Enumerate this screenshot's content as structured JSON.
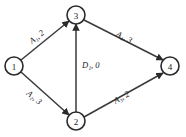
{
  "diagram": {
    "background_color": "#ffffff",
    "line_color": "#3a3a3a",
    "node_stroke_color": "#2b2b2b",
    "text_color": "#1a1a1a",
    "nodes": [
      {
        "id": "node-1",
        "label": "1",
        "cx": 14,
        "cy": 66,
        "r": 9
      },
      {
        "id": "node-3",
        "label": "3",
        "cx": 76,
        "cy": 15,
        "r": 9
      },
      {
        "id": "node-2",
        "label": "2",
        "cx": 76,
        "cy": 121,
        "r": 9
      },
      {
        "id": "node-4",
        "label": "4",
        "cx": 170,
        "cy": 66,
        "r": 9
      }
    ],
    "edges": [
      {
        "id": "edge-1-3",
        "from": "1",
        "to": "3",
        "activity": "A",
        "subscript": "1",
        "duration": "2",
        "label": "A₁, 2",
        "label_x": 30,
        "label_y": 42,
        "label_rotation": -39
      },
      {
        "id": "edge-1-2",
        "from": "1",
        "to": "2",
        "activity": "A",
        "subscript": "2",
        "duration": "3",
        "label": "A₂, 3",
        "label_x": 28,
        "label_y": 92,
        "label_rotation": 39
      },
      {
        "id": "edge-2-3",
        "from": "2",
        "to": "3",
        "activity": "D",
        "subscript": "1",
        "duration": "0",
        "label": "D₁, 0",
        "label_x": 82,
        "label_y": 65,
        "label_rotation": 0
      },
      {
        "id": "edge-3-4",
        "from": "3",
        "to": "4",
        "activity": "A",
        "subscript": "4",
        "duration": "3",
        "label": "A₄, 3",
        "label_x": 117,
        "label_y": 33,
        "label_rotation": 28
      },
      {
        "id": "edge-2-4",
        "from": "2",
        "to": "4",
        "activity": "A",
        "subscript": "3",
        "duration": "2",
        "label": "A₃, 2",
        "label_x": 114,
        "label_y": 101,
        "label_rotation": -28
      }
    ]
  }
}
